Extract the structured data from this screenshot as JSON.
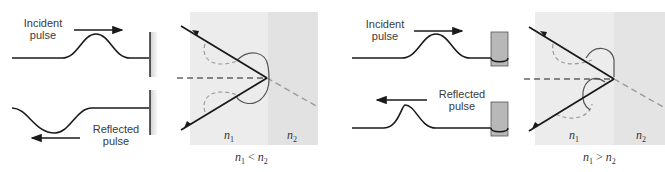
{
  "left_case": {
    "incident_label": [
      "Incident",
      "pulse"
    ],
    "reflected_label": [
      "Reflected",
      "pulse"
    ],
    "boundary": "fixed-wall",
    "reflected_inverted": true,
    "media": {
      "n1": "n",
      "n1_sub": "1",
      "n2": "n",
      "n2_sub": "2"
    },
    "caption": {
      "a": "n",
      "a_sub": "1",
      "rel": "<",
      "b": "n",
      "b_sub": "2"
    }
  },
  "right_case": {
    "incident_label": [
      "Incident",
      "pulse"
    ],
    "reflected_label": [
      "Reflected",
      "pulse"
    ],
    "boundary": "free-ring-on-rod",
    "reflected_inverted": false,
    "media": {
      "n1": "n",
      "n1_sub": "1",
      "n2": "n",
      "n2_sub": "2"
    },
    "caption": {
      "a": "n",
      "a_sub": "1",
      "rel": ">",
      "b": "n",
      "b_sub": "2"
    }
  },
  "colors": {
    "line": "#1a1a1a",
    "dashed_gray": "#9a9a9a",
    "panel_n1": "#ececec",
    "panel_n2": "#e2e2e2",
    "rod": "#b8b8b8"
  }
}
